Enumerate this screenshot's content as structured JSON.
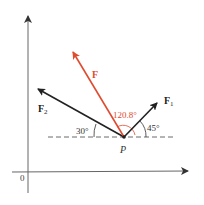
{
  "colors": {
    "background": "#ffffff",
    "axis": "#555555",
    "vector": "#222222",
    "resultant": "#e04b2e",
    "dashed": "#444444"
  },
  "labels": {
    "origin": "0",
    "point": "P",
    "resultant": "F",
    "force1": "F",
    "force1_sub": "1",
    "force2": "F",
    "force2_sub": "2",
    "angle_resultant": "120.8°",
    "angle_force1": "45°",
    "angle_force2": "30°"
  },
  "vectors": [
    {
      "name": "F",
      "magnitude_angle_deg": 120.8,
      "color": "resultant"
    },
    {
      "name": "F1",
      "magnitude_angle_deg": 45,
      "color": "vector"
    },
    {
      "name": "F2",
      "magnitude_angle_deg": 150,
      "color": "vector"
    }
  ]
}
